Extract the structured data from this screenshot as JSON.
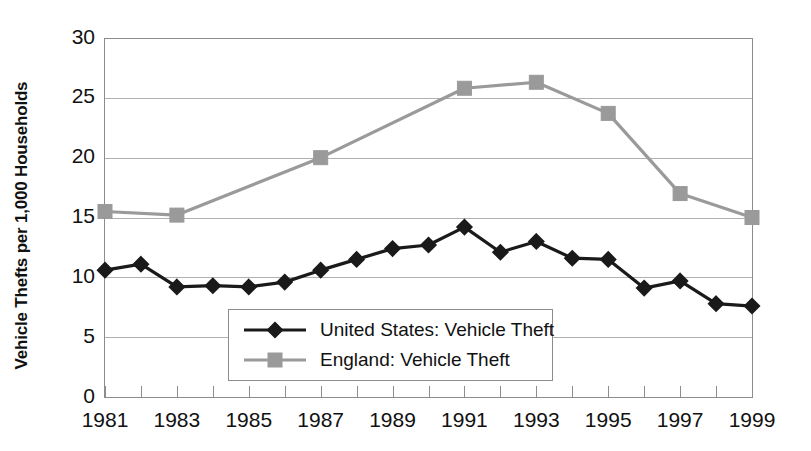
{
  "chart_data": {
    "type": "line",
    "title": "",
    "xlabel": "",
    "ylabel": "Vehicle Thefts per 1,000 Households",
    "xlim": [
      1981,
      1999
    ],
    "ylim": [
      0,
      30
    ],
    "yticks": [
      0,
      5,
      10,
      15,
      20,
      25,
      30
    ],
    "ytick_labels": [
      "0",
      "5",
      "10",
      "15",
      "20",
      "25",
      "30"
    ],
    "x": [
      1981,
      1982,
      1983,
      1984,
      1985,
      1986,
      1987,
      1988,
      1989,
      1990,
      1991,
      1992,
      1993,
      1994,
      1995,
      1996,
      1997,
      1998,
      1999
    ],
    "xticks": [
      1981,
      1982,
      1983,
      1984,
      1985,
      1986,
      1987,
      1988,
      1989,
      1990,
      1991,
      1992,
      1993,
      1994,
      1995,
      1996,
      1997,
      1998,
      1999
    ],
    "xtick_labels": [
      "1981",
      "",
      "1983",
      "",
      "1985",
      "",
      "1987",
      "",
      "1989",
      "",
      "1991",
      "",
      "1993",
      "",
      "1995",
      "",
      "1997",
      "",
      "1999"
    ],
    "xtick_labels_shown": [
      "1981",
      "1983",
      "1985",
      "1987",
      "1989",
      "1991",
      "1993",
      "1995",
      "1997",
      "1999"
    ],
    "grid": true,
    "grid_axis": "y",
    "legend_position": "center",
    "series": [
      {
        "name": "United States: Vehicle Theft",
        "color": "#1a1a1a",
        "marker": "diamond",
        "x": [
          1981,
          1982,
          1983,
          1984,
          1985,
          1986,
          1987,
          1988,
          1989,
          1990,
          1991,
          1992,
          1993,
          1994,
          1995,
          1996,
          1997,
          1998,
          1999
        ],
        "values": [
          10.6,
          11.1,
          9.2,
          9.3,
          9.2,
          9.6,
          10.6,
          11.5,
          12.4,
          12.7,
          14.2,
          12.1,
          13.0,
          11.6,
          11.5,
          9.1,
          9.7,
          7.8,
          7.6
        ]
      },
      {
        "name": "England: Vehicle Theft",
        "color": "#9a9a9a",
        "marker": "square",
        "x": [
          1981,
          1983,
          1987,
          1991,
          1993,
          1995,
          1997,
          1999
        ],
        "values": [
          15.5,
          15.2,
          20.0,
          25.8,
          26.3,
          23.7,
          17.0,
          15.0
        ]
      }
    ]
  },
  "legend": {
    "items": [
      {
        "label": "United States: Vehicle Theft",
        "color": "#1a1a1a",
        "marker": "diamond"
      },
      {
        "label": "England: Vehicle Theft",
        "color": "#9a9a9a",
        "marker": "square"
      }
    ]
  }
}
